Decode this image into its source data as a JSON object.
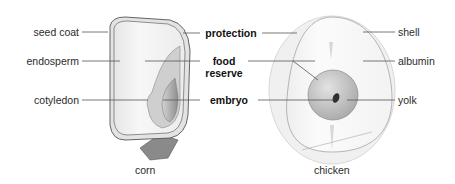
{
  "diagram": {
    "corn": {
      "caption": "corn",
      "labels": [
        "seed coat",
        "endosperm",
        "cotyledon"
      ]
    },
    "chicken": {
      "caption": "chicken",
      "labels": [
        "shell",
        "albumin",
        "yolk"
      ]
    },
    "functions": {
      "protection": "protection",
      "food_reserve_line1": "food",
      "food_reserve_line2": "reserve",
      "embryo": "embryo"
    },
    "colors": {
      "line": "#555555",
      "seed_coat": "#e8e8e8",
      "endosperm": "#f4f4f4",
      "embryo_corn": "#b8b8b8",
      "yolk": "#c9c9c9",
      "egg_embryo": "#333333"
    }
  }
}
